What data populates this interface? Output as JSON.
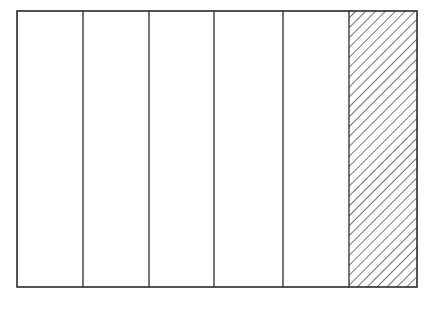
{
  "diagram": {
    "type": "fraction-bar",
    "total_parts": 6,
    "shaded_parts": 1,
    "shaded_index": 5,
    "fraction": "1/6",
    "frame": {
      "x": 17,
      "y": 11,
      "width": 400,
      "height": 276
    },
    "divider_x": [
      83,
      149,
      214,
      283,
      349
    ],
    "colors": {
      "line": "#2a2a2a",
      "background": "#ffffff",
      "hatch": "#2a2a2a"
    },
    "hatch": {
      "direction": "top-left-to-bottom-right",
      "spacing": 7
    }
  }
}
